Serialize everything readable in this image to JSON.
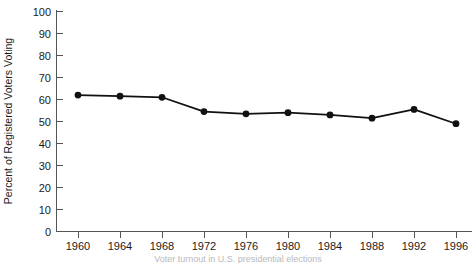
{
  "chart_data": {
    "type": "line",
    "title": "",
    "xlabel": "",
    "ylabel": "Percent of Registered Voters Voting",
    "caption": "Voter turnout in U.S. presidential elections",
    "categories": [
      "1960",
      "1964",
      "1968",
      "1972",
      "1976",
      "1980",
      "1984",
      "1988",
      "1992",
      "1996"
    ],
    "x": [
      1960,
      1964,
      1968,
      1972,
      1976,
      1980,
      1984,
      1988,
      1992,
      1996
    ],
    "values": [
      62,
      61.5,
      61,
      54.5,
      53.5,
      54,
      53,
      51.5,
      55.5,
      49
    ],
    "series": [
      {
        "name": "Percent of Registered Voters Voting",
        "values": [
          62,
          61.5,
          61,
          54.5,
          53.5,
          54,
          53,
          51.5,
          55.5,
          49
        ]
      }
    ],
    "ylim": [
      0,
      100
    ],
    "yticks": [
      0,
      10,
      20,
      30,
      40,
      50,
      60,
      70,
      80,
      90,
      100
    ],
    "ytick_labels": [
      "0",
      "10",
      "20",
      "30",
      "40",
      "50",
      "60",
      "70",
      "80",
      "90",
      "100"
    ],
    "xtick_labels": [
      "1960",
      "1964",
      "1968",
      "1972",
      "1976",
      "1980",
      "1984",
      "1988",
      "1992",
      "1996"
    ],
    "grid": false,
    "legend": "none",
    "marker": "filled-circle",
    "line_color": "#111111",
    "marker_color": "#111111",
    "axis_color": "#555555",
    "background": "#ffffff"
  },
  "axes": {
    "y_axis_title": "Percent of Registered Voters Voting",
    "y_min_label": "0",
    "y_max_label": "100"
  }
}
